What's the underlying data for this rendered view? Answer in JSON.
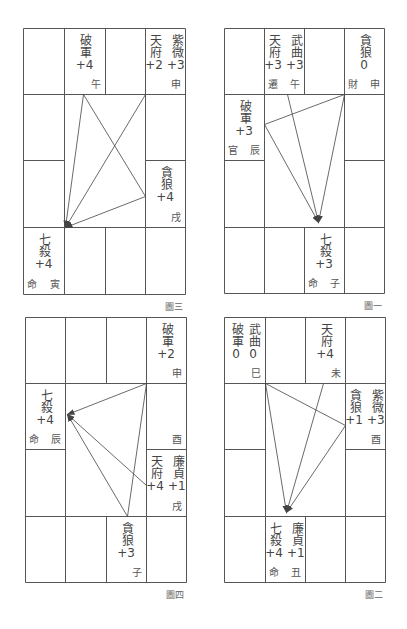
{
  "charts": [
    {
      "id": "fig3",
      "caption": "圖三",
      "origin": [
        23,
        28
      ],
      "cols": [
        0,
        41,
        82,
        122,
        162
      ],
      "rows": [
        0,
        66,
        132,
        199,
        266
      ],
      "cells": [
        {
          "col": 1,
          "row": 0,
          "stars": [
            {
              "name": "破軍",
              "value": "+4"
            }
          ],
          "branch": "午",
          "palace": ""
        },
        {
          "col": 3,
          "row": 0,
          "stars": [
            {
              "name": "天府",
              "value": "+2"
            },
            {
              "name": "紫微",
              "value": "+3"
            }
          ],
          "branch": "申",
          "palace": ""
        },
        {
          "col": 3,
          "row": 2,
          "stars": [
            {
              "name": "貪狼",
              "value": "+4"
            }
          ],
          "branch": "戌",
          "palace": ""
        },
        {
          "col": 0,
          "row": 3,
          "stars": [
            {
              "name": "七殺",
              "value": "+4"
            }
          ],
          "branch": "寅",
          "palace": "命"
        }
      ],
      "lines": [
        {
          "from": [
            60,
            66
          ],
          "to": [
            42,
            199
          ],
          "arrow": true
        },
        {
          "from": [
            60,
            66
          ],
          "to": [
            122,
            168
          ],
          "arrow": false
        },
        {
          "from": [
            122,
            66
          ],
          "to": [
            42,
            199
          ],
          "arrow": true
        },
        {
          "from": [
            122,
            168
          ],
          "to": [
            42,
            199
          ],
          "arrow": true
        }
      ]
    },
    {
      "id": "fig1",
      "caption": "圖一",
      "origin": [
        224,
        28
      ],
      "cols": [
        0,
        40,
        80,
        120,
        160
      ],
      "rows": [
        0,
        66,
        132,
        199,
        265
      ],
      "cells": [
        {
          "col": 1,
          "row": 0,
          "stars": [
            {
              "name": "天府",
              "value": "+3"
            },
            {
              "name": "武曲",
              "value": "+3"
            }
          ],
          "branch": "午",
          "palace": "遷"
        },
        {
          "col": 3,
          "row": 0,
          "stars": [
            {
              "name": "貪狼",
              "value": "0"
            }
          ],
          "branch": "申",
          "palace": "財"
        },
        {
          "col": 0,
          "row": 1,
          "stars": [
            {
              "name": "破軍",
              "value": "+3"
            }
          ],
          "branch": "辰",
          "palace": "官"
        },
        {
          "col": 2,
          "row": 3,
          "stars": [
            {
              "name": "七殺",
              "value": "+3"
            }
          ],
          "branch": "子",
          "palace": "命"
        }
      ],
      "lines": [
        {
          "from": [
            120,
            66
          ],
          "to": [
            40,
            96
          ],
          "arrow": false
        },
        {
          "from": [
            40,
            96
          ],
          "to": [
            94,
            194
          ],
          "arrow": true
        },
        {
          "from": [
            63,
            66
          ],
          "to": [
            94,
            194
          ],
          "arrow": true
        },
        {
          "from": [
            120,
            66
          ],
          "to": [
            94,
            194
          ],
          "arrow": true
        }
      ]
    },
    {
      "id": "fig4",
      "caption": "圖四",
      "origin": [
        25,
        317
      ],
      "cols": [
        0,
        40,
        81,
        121,
        161
      ],
      "rows": [
        0,
        66,
        132,
        199,
        265
      ],
      "cells": [
        {
          "col": 3,
          "row": 0,
          "stars": [
            {
              "name": "破軍",
              "value": "+2"
            }
          ],
          "branch": "申",
          "palace": ""
        },
        {
          "col": 0,
          "row": 1,
          "stars": [
            {
              "name": "七殺",
              "value": "+4"
            }
          ],
          "branch": "辰",
          "palace": "命"
        },
        {
          "col": 3,
          "row": 1,
          "stars": [],
          "branch": "酉",
          "palace": ""
        },
        {
          "col": 3,
          "row": 2,
          "stars": [
            {
              "name": "天府",
              "value": "+4"
            },
            {
              "name": "廉貞",
              "value": "+1"
            }
          ],
          "branch": "戌",
          "palace": ""
        },
        {
          "col": 2,
          "row": 3,
          "stars": [
            {
              "name": "貪狼",
              "value": "+3"
            }
          ],
          "branch": "子",
          "palace": ""
        }
      ],
      "lines": [
        {
          "from": [
            121,
            66
          ],
          "to": [
            42,
            97
          ],
          "arrow": true
        },
        {
          "from": [
            121,
            66
          ],
          "to": [
            102,
            199
          ],
          "arrow": false
        },
        {
          "from": [
            102,
            199
          ],
          "to": [
            42,
            97
          ],
          "arrow": true
        },
        {
          "from": [
            121,
            168
          ],
          "to": [
            42,
            97
          ],
          "arrow": true
        }
      ]
    },
    {
      "id": "fig2",
      "caption": "圖二",
      "origin": [
        224,
        317
      ],
      "cols": [
        0,
        41,
        81,
        121,
        161
      ],
      "rows": [
        0,
        66,
        132,
        199,
        265
      ],
      "cells": [
        {
          "col": 0,
          "row": 0,
          "stars": [
            {
              "name": "破軍",
              "value": "0"
            },
            {
              "name": "武曲",
              "value": "0"
            }
          ],
          "branch": "巳",
          "palace": ""
        },
        {
          "col": 2,
          "row": 0,
          "stars": [
            {
              "name": "天府",
              "value": "+4"
            }
          ],
          "branch": "未",
          "palace": ""
        },
        {
          "col": 3,
          "row": 1,
          "stars": [
            {
              "name": "貪狼",
              "value": "+1"
            },
            {
              "name": "紫微",
              "value": "+3"
            }
          ],
          "branch": "酉",
          "palace": ""
        },
        {
          "col": 1,
          "row": 3,
          "stars": [
            {
              "name": "七殺",
              "value": "+4"
            },
            {
              "name": "廉貞",
              "value": "+1"
            }
          ],
          "branch": "丑",
          "palace": "命"
        }
      ],
      "lines": [
        {
          "from": [
            41,
            66
          ],
          "to": [
            121,
            108
          ],
          "arrow": false
        },
        {
          "from": [
            41,
            66
          ],
          "to": [
            62,
            195
          ],
          "arrow": true
        },
        {
          "from": [
            99,
            66
          ],
          "to": [
            62,
            195
          ],
          "arrow": true
        },
        {
          "from": [
            121,
            108
          ],
          "to": [
            62,
            195
          ],
          "arrow": true
        }
      ]
    }
  ],
  "style": {
    "line_color": "#444444",
    "grid_color": "#555555",
    "text_color": "#444444"
  }
}
